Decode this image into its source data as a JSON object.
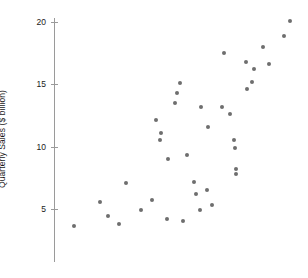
{
  "chart_data": {
    "type": "scatter",
    "title": "",
    "xlabel": "",
    "ylabel": "Quarterly Sales ($ billion)",
    "ylim": [
      0,
      20.8
    ],
    "xlim": [
      0,
      1
    ],
    "grid": false,
    "legend": null,
    "y_ticks": [
      5,
      10,
      15,
      20
    ],
    "y_tick_labels": [
      "5",
      "10",
      "15",
      "20"
    ],
    "x_ticks": [],
    "x_tick_labels": [],
    "marker": {
      "color": "#6e6e6e",
      "size_px": 4,
      "shape": "circle"
    },
    "axis_color": "#9a9a9a",
    "series": [
      {
        "name": "Quarterly Sales",
        "points": [
          [
            0.077,
            3.6
          ],
          [
            0.185,
            5.6
          ],
          [
            0.216,
            4.4
          ],
          [
            0.262,
            3.8
          ],
          [
            0.293,
            7.1
          ],
          [
            0.355,
            4.9
          ],
          [
            0.4,
            5.7
          ],
          [
            0.416,
            12.1
          ],
          [
            0.436,
            11.1
          ],
          [
            0.432,
            10.5
          ],
          [
            0.462,
            4.2
          ],
          [
            0.468,
            9.0
          ],
          [
            0.495,
            13.5
          ],
          [
            0.505,
            14.3
          ],
          [
            0.516,
            15.1
          ],
          [
            0.529,
            4.0
          ],
          [
            0.545,
            9.3
          ],
          [
            0.576,
            7.2
          ],
          [
            0.585,
            6.2
          ],
          [
            0.6,
            4.9
          ],
          [
            0.606,
            13.2
          ],
          [
            0.629,
            6.5
          ],
          [
            0.635,
            11.6
          ],
          [
            0.652,
            5.3
          ],
          [
            0.69,
            13.2
          ],
          [
            0.7,
            17.5
          ],
          [
            0.726,
            12.6
          ],
          [
            0.741,
            10.5
          ],
          [
            0.744,
            9.9
          ],
          [
            0.748,
            8.2
          ],
          [
            0.752,
            7.8
          ],
          [
            0.79,
            16.8
          ],
          [
            0.795,
            14.6
          ],
          [
            0.818,
            15.2
          ],
          [
            0.823,
            16.2
          ],
          [
            0.861,
            18.0
          ],
          [
            0.889,
            16.6
          ],
          [
            0.952,
            18.9
          ],
          [
            0.975,
            20.1
          ]
        ]
      }
    ]
  },
  "axis": {
    "y_label_text": "Quarterly Sales ($ billion)"
  }
}
